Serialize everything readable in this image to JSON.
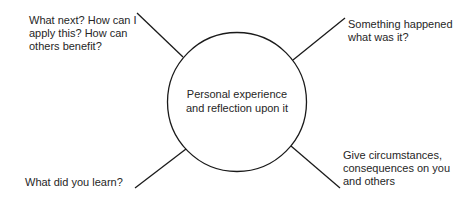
{
  "diagram": {
    "center": {
      "line1": "Personal experience",
      "line2": "and reflection upon it"
    },
    "spokes": [
      {
        "position": "top-left",
        "lines": [
          "What next? How can I",
          "apply this? How can",
          "others benefit?"
        ]
      },
      {
        "position": "top-right",
        "lines": [
          "Something happened",
          "what was it?"
        ]
      },
      {
        "position": "bottom-left",
        "lines": [
          "What did you learn?"
        ]
      },
      {
        "position": "bottom-right",
        "lines": [
          "Give circumstances,",
          "consequences on you",
          "and others"
        ]
      }
    ],
    "colors": {
      "stroke": "#1a1a1a",
      "text": "#262626",
      "background": "#ffffff"
    }
  }
}
